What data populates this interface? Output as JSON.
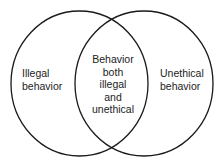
{
  "diagram": {
    "type": "venn",
    "stroke_color": "#1a1a1a",
    "background_color": "#ffffff",
    "sets": [
      {
        "id": "illegal",
        "label_lines": [
          "Illegal",
          "behavior"
        ]
      },
      {
        "id": "unethical",
        "label_lines": [
          "Unethical",
          "behavior"
        ]
      }
    ],
    "intersection": {
      "label_lines": [
        "Behavior",
        "both",
        "illegal",
        "and",
        "unethical"
      ]
    }
  }
}
